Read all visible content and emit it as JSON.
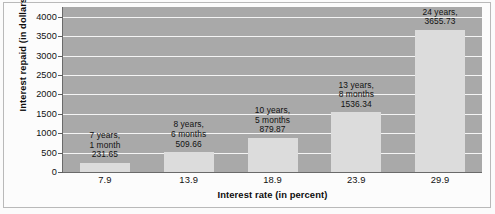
{
  "chart_data": {
    "type": "bar",
    "title": "",
    "xlabel": "Interest rate (in percent)",
    "ylabel": "Interest repaid (in dollars)",
    "categories": [
      "7.9",
      "13.9",
      "18.9",
      "23.9",
      "29.9"
    ],
    "values": [
      231.65,
      509.66,
      879.87,
      1536.34,
      3655.73
    ],
    "ylim": [
      0,
      4250
    ],
    "yticks": [
      "0",
      "500",
      "1000",
      "1500",
      "2000",
      "2500",
      "3000",
      "3500",
      "4000"
    ],
    "ytick_values": [
      0,
      500,
      1000,
      1500,
      2000,
      2500,
      3000,
      3500,
      4000
    ],
    "grid": true,
    "legend": false,
    "annotations": [
      {
        "line1": "7 years,",
        "line2": "1 month",
        "line3": "231.65"
      },
      {
        "line1": "8 years,",
        "line2": "6 months",
        "line3": "509.66"
      },
      {
        "line1": "10 years,",
        "line2": "5 months",
        "line3": "879.87"
      },
      {
        "line1": "13 years,",
        "line2": "8 months",
        "line3": "1536.34"
      },
      {
        "line1": "24 years,",
        "line2": "3655.73",
        "line3": ""
      }
    ],
    "colors": {
      "plot_background": "#a9a9a9",
      "bar_fill": "#dcdcdc",
      "gridline": "#f4f4f4",
      "text": "#111111",
      "figure_background": "#fcfcfc"
    }
  }
}
